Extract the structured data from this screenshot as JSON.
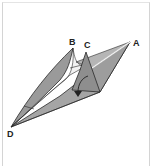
{
  "diagram": {
    "type": "origami-fold-step",
    "labels": {
      "a": "A",
      "b": "B",
      "c": "C",
      "d": "D"
    },
    "colors": {
      "paper_fill": "#9a9a9a",
      "paper_light": "#c4c4c4",
      "inner_white": "#f2f2f2",
      "line": "#2a2a2a",
      "frame": "#d4d4d4"
    },
    "arrow": "fold-down-arrow"
  }
}
